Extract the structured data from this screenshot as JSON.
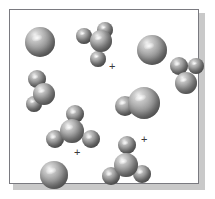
{
  "figure": {
    "kind": "molecular-reaction-illustration",
    "panel": {
      "background_color": "#ffffff",
      "border_color": "#7a7a80",
      "shadow_color": "#c9c9c9"
    },
    "atom_style": {
      "render": "space-filling-cpk",
      "highlight_color": "#f0f0f0",
      "midtone_color": "#9e9e9e",
      "shadow_color": "#575757"
    },
    "operators": [
      {
        "name": "plus-1",
        "symbol": "+",
        "x": 99,
        "y": 51
      },
      {
        "name": "plus-2",
        "symbol": "+",
        "x": 64,
        "y": 137
      },
      {
        "name": "plus-3",
        "symbol": "+",
        "x": 131,
        "y": 124
      }
    ],
    "species": [
      {
        "name": "lone-sphere-top-left",
        "label": "single atom",
        "atom_count": 1,
        "atoms": [
          {
            "cx": 30,
            "cy": 32,
            "r": 15,
            "big": true
          }
        ]
      },
      {
        "name": "tetrahedral-molecule-top-center",
        "label": "tetrahedral molecule",
        "atom_count": 4,
        "atoms": [
          {
            "cx": 91,
            "cy": 31,
            "r": 11,
            "big": true
          },
          {
            "cx": 74,
            "cy": 26,
            "r": 8,
            "big": false
          },
          {
            "cx": 95,
            "cy": 20,
            "r": 8,
            "big": false
          },
          {
            "cx": 88,
            "cy": 49,
            "r": 8,
            "big": false
          }
        ]
      },
      {
        "name": "lone-sphere-top-right",
        "label": "single atom",
        "atom_count": 1,
        "atoms": [
          {
            "cx": 142,
            "cy": 40,
            "r": 15,
            "big": true
          }
        ]
      },
      {
        "name": "bent-molecule-right",
        "label": "bent triatomic molecule",
        "atom_count": 3,
        "atoms": [
          {
            "cx": 176,
            "cy": 73,
            "r": 11,
            "big": true
          },
          {
            "cx": 169,
            "cy": 56,
            "r": 9,
            "big": false
          },
          {
            "cx": 186,
            "cy": 56,
            "r": 8,
            "big": false
          }
        ]
      },
      {
        "name": "bent-molecule-left",
        "label": "bent triatomic molecule",
        "atom_count": 3,
        "atoms": [
          {
            "cx": 34,
            "cy": 84,
            "r": 11,
            "big": true
          },
          {
            "cx": 27,
            "cy": 69,
            "r": 9,
            "big": false
          },
          {
            "cx": 24,
            "cy": 94,
            "r": 8,
            "big": false
          }
        ]
      },
      {
        "name": "diatomic-molecule-center",
        "label": "diatomic molecule",
        "atom_count": 2,
        "atoms": [
          {
            "cx": 134,
            "cy": 93,
            "r": 16,
            "big": true
          },
          {
            "cx": 115,
            "cy": 96,
            "r": 10,
            "big": false
          }
        ]
      },
      {
        "name": "tetrahedral-molecule-lower-left",
        "label": "tetrahedral molecule",
        "atom_count": 4,
        "atoms": [
          {
            "cx": 62,
            "cy": 121,
            "r": 12,
            "big": true
          },
          {
            "cx": 65,
            "cy": 104,
            "r": 9,
            "big": false
          },
          {
            "cx": 45,
            "cy": 129,
            "r": 9,
            "big": false
          },
          {
            "cx": 81,
            "cy": 129,
            "r": 9,
            "big": false
          }
        ]
      },
      {
        "name": "tetrahedral-molecule-bottom-center",
        "label": "tetrahedral molecule",
        "atom_count": 4,
        "atoms": [
          {
            "cx": 116,
            "cy": 155,
            "r": 12,
            "big": true
          },
          {
            "cx": 117,
            "cy": 135,
            "r": 9,
            "big": false
          },
          {
            "cx": 101,
            "cy": 166,
            "r": 9,
            "big": false
          },
          {
            "cx": 132,
            "cy": 164,
            "r": 9,
            "big": false
          }
        ]
      },
      {
        "name": "lone-sphere-bottom-left",
        "label": "single atom",
        "atom_count": 1,
        "atoms": [
          {
            "cx": 44,
            "cy": 165,
            "r": 14,
            "big": true
          }
        ]
      }
    ]
  }
}
